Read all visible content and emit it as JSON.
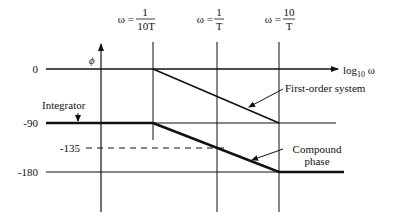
{
  "diagram": {
    "axes": {
      "y_symbol": "ϕ",
      "x_label_main": "log",
      "x_label_sub": "10",
      "x_label_var": " ω"
    },
    "y_ticks": [
      {
        "label": "0",
        "value": 0
      },
      {
        "label": "-90",
        "value": -90
      },
      {
        "label": "-135",
        "value": -135
      },
      {
        "label": "-180",
        "value": -180
      }
    ],
    "frequency_markers": [
      {
        "prefix": "ω =",
        "numerator": "1",
        "denominator": "10T"
      },
      {
        "prefix": "ω =",
        "numerator": "1",
        "denominator": "T"
      },
      {
        "prefix": "ω =",
        "numerator": "10",
        "denominator": "T"
      }
    ],
    "annotations": {
      "integrator": "Integrator",
      "first_order": "First-order system",
      "compound_line1": "Compound",
      "compound_line2": "phase"
    },
    "colors": {
      "ink": "#111111",
      "background": "#ffffff"
    }
  }
}
